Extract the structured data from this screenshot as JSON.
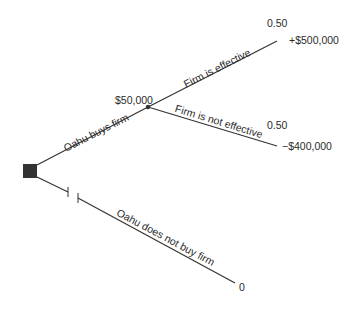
{
  "diagram": {
    "type": "decision-tree",
    "colors": {
      "line": "#333333",
      "node": "#333333",
      "text": "#2a2a2a",
      "background": "#ffffff"
    },
    "decision_node": {
      "shape": "square"
    },
    "branches": {
      "buy": {
        "label": "Oahu buys firm",
        "expected_value": "$50,000"
      },
      "not_buy": {
        "label": "Oahu does not buy firm",
        "payoff": "0",
        "pruned": true
      }
    },
    "chance_node": {
      "outcomes": [
        {
          "label": "Firm is effective",
          "probability": "0.50",
          "payoff": "+$500,000"
        },
        {
          "label": "Firm is not effective",
          "probability": "0.50",
          "payoff": "−$400,000"
        }
      ]
    }
  }
}
